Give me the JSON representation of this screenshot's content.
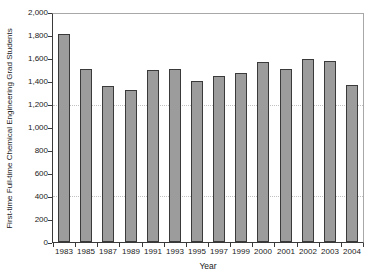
{
  "figure": {
    "width_px": 376,
    "height_px": 278,
    "background": "#ffffff"
  },
  "chart_data": {
    "type": "bar",
    "title": "",
    "xlabel": "Year",
    "ylabel": "First-time Full-time Chemical Engineering Grad Students",
    "categories": [
      "1983",
      "1985",
      "1987",
      "1989",
      "1991",
      "1993",
      "1995",
      "1997",
      "1999",
      "2000",
      "2001",
      "2002",
      "2003",
      "2004"
    ],
    "values": [
      1825,
      1520,
      1365,
      1330,
      1505,
      1520,
      1410,
      1455,
      1485,
      1580,
      1520,
      1605,
      1590,
      1380
    ],
    "ylim": [
      0,
      2000
    ],
    "ytick_step": 200,
    "ytick_labels": [
      "0",
      "200",
      "400",
      "600",
      "800",
      "1,000",
      "1,200",
      "1,400",
      "1,600",
      "1,800",
      "2,000"
    ],
    "gridlines_y": [
      400,
      1200
    ],
    "grid_style": "dotted",
    "legend_position": "none",
    "colors": {
      "bar_fill": "#9c9c9c",
      "bar_border": "#3a3a3a",
      "axis_line": "#3a3a3a",
      "plot_box": "#a8a8a8",
      "gridline": "#c2c2c2",
      "text": "#1a1a1a",
      "background": "#ffffff"
    }
  }
}
